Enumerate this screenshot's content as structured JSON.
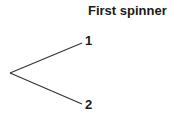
{
  "diagram": {
    "title": "First spinner",
    "type": "tree",
    "root": {
      "x": 10,
      "y": 73
    },
    "branches": [
      {
        "label": "1",
        "end": {
          "x": 82,
          "y": 43
        }
      },
      {
        "label": "2",
        "end": {
          "x": 82,
          "y": 104
        }
      }
    ],
    "line_color": "#333333"
  }
}
